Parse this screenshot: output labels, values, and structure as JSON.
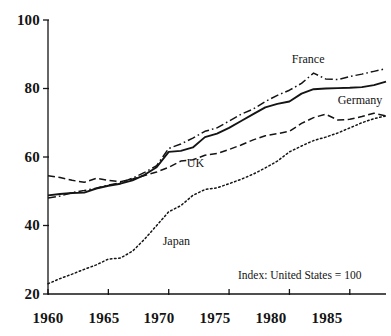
{
  "chart_data": {
    "type": "line",
    "title": "",
    "subtitle": "",
    "xlabel": "",
    "ylabel": "",
    "xlim": [
      1960,
      1988
    ],
    "ylim": [
      20,
      100
    ],
    "grid": false,
    "legend_position": "inline-labels",
    "annotation": "Index: United States = 100",
    "x_ticks": [
      "1960",
      "1965",
      "1970",
      "1975",
      "1980",
      "1985"
    ],
    "x_tick_values": [
      1960,
      1965,
      1970,
      1975,
      1980,
      1985
    ],
    "y_ticks": [
      "20",
      "40",
      "60",
      "80",
      "100"
    ],
    "y_tick_values": [
      20,
      40,
      60,
      80,
      100
    ],
    "x": [
      1960,
      1961,
      1962,
      1963,
      1964,
      1965,
      1966,
      1967,
      1968,
      1969,
      1970,
      1971,
      1972,
      1973,
      1974,
      1975,
      1976,
      1977,
      1978,
      1979,
      1980,
      1981,
      1982,
      1983,
      1984,
      1985,
      1986,
      1987,
      1988
    ],
    "series": [
      {
        "name": "France",
        "style": "dash-dot",
        "label": "France",
        "label_x": 1980.2,
        "label_y": 88.5,
        "values": [
          48.0,
          48.6,
          49.6,
          50.2,
          50.9,
          51.8,
          52.5,
          53.8,
          55.5,
          57.5,
          62.5,
          63.8,
          65.5,
          67.5,
          68.5,
          70.5,
          72.5,
          74.0,
          76.2,
          78.0,
          79.5,
          81.5,
          84.5,
          82.8,
          82.6,
          83.5,
          84.2,
          85.0,
          85.8
        ]
      },
      {
        "name": "Germany",
        "style": "solid",
        "label": "Germany",
        "label_x": 1984.0,
        "label_y": 76.5,
        "values": [
          48.8,
          49.2,
          49.5,
          49.6,
          50.8,
          51.6,
          52.2,
          53.2,
          54.8,
          57.0,
          61.5,
          61.8,
          62.8,
          65.8,
          66.8,
          68.5,
          70.5,
          72.5,
          74.5,
          75.5,
          76.2,
          78.5,
          79.8,
          80.0,
          80.1,
          80.2,
          80.4,
          81.0,
          82.0
        ]
      },
      {
        "name": "UK",
        "style": "dashed",
        "label": "UK",
        "label_x": 1971.5,
        "label_y": 58.2,
        "values": [
          54.5,
          54.0,
          53.2,
          52.6,
          53.8,
          53.2,
          52.8,
          53.6,
          54.6,
          55.6,
          57.0,
          58.8,
          59.2,
          60.5,
          61.0,
          62.2,
          63.5,
          65.0,
          66.2,
          66.8,
          67.5,
          69.8,
          71.5,
          72.5,
          70.8,
          71.0,
          71.8,
          72.8,
          72.0
        ]
      },
      {
        "name": "Japan",
        "style": "dotted",
        "label": "Japan",
        "label_x": 1969.5,
        "label_y": 35.5,
        "values": [
          23.0,
          24.5,
          25.8,
          27.2,
          28.5,
          30.2,
          30.5,
          32.5,
          36.0,
          40.0,
          44.0,
          45.8,
          48.8,
          50.5,
          51.0,
          52.2,
          53.5,
          55.0,
          56.8,
          58.8,
          61.5,
          63.2,
          64.8,
          65.8,
          67.0,
          68.5,
          70.0,
          71.2,
          72.0
        ]
      }
    ]
  },
  "axes": {
    "y_labels": [
      "100",
      "80",
      "60",
      "40",
      "20"
    ],
    "x_labels": [
      "1960",
      "1965",
      "1970",
      "1975",
      "1980",
      "1985"
    ]
  },
  "labels": {
    "france": "France",
    "germany": "Germany",
    "uk": "UK",
    "japan": "Japan",
    "index_note": "Index: United States = 100"
  },
  "colors": {
    "ink": "#141414",
    "background": "#ffffff"
  }
}
